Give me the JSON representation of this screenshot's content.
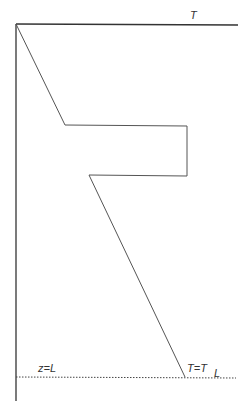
{
  "diagram": {
    "type": "temperature-depth profile",
    "labels": {
      "top_axis": "T",
      "bottom_depth": "z=L",
      "bottom_temp": "T=T",
      "bottom_temp_sub": "L"
    },
    "colors": {
      "axis": "#333333",
      "profile": "#555555",
      "dotted": "#444444",
      "background": "#ffffff"
    },
    "profile_points": [
      [
        16,
        24
      ],
      [
        65,
        125
      ],
      [
        187,
        126
      ],
      [
        187,
        176
      ],
      [
        89,
        175
      ],
      [
        185,
        377
      ]
    ]
  }
}
